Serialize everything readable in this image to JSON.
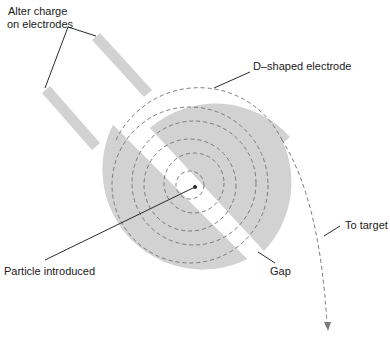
{
  "labels": {
    "alter_charge_line1": "Alter charge",
    "alter_charge_line2": "on electrodes",
    "d_electrode": "D–shaped electrode",
    "to_target": "To target",
    "particle_introduced": "Particle introduced",
    "gap": "Gap"
  },
  "colors": {
    "electrode_fill": "#d2d2d2",
    "path_stroke": "#7a7a7a",
    "leader_line": "#2a2a2a",
    "text": "#1a1a1a",
    "background": "#ffffff"
  },
  "geometry": {
    "disc_center": [
      192,
      184
    ],
    "disc_radius": 100,
    "gap_width": 18,
    "spiral_radii": [
      14,
      30,
      46,
      62,
      78,
      92
    ]
  }
}
